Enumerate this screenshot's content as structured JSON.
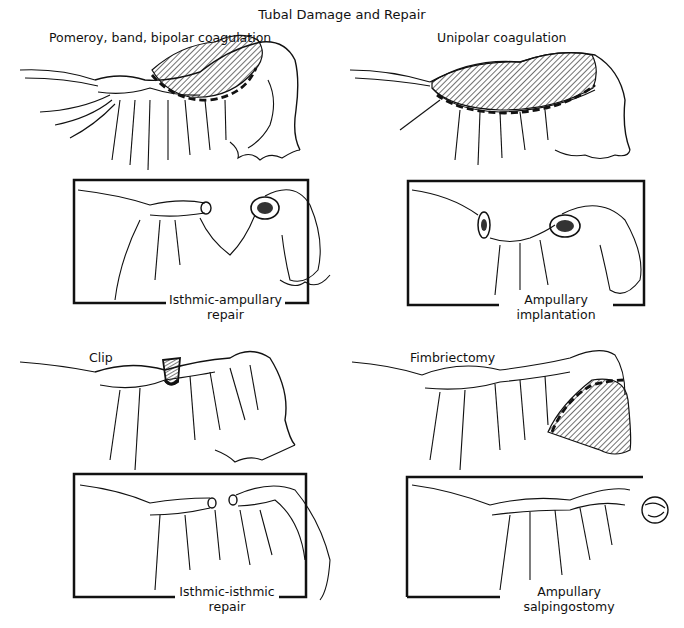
{
  "title": "Tubal Damage and Repair",
  "panels": [
    {
      "id": "top-left",
      "damage_label": "Pomeroy, band, bipolar coagulation",
      "repair_caption_line1": "Isthmic-ampullary",
      "repair_caption_line2": "repair"
    },
    {
      "id": "top-right",
      "damage_label": "Unipolar coagulation",
      "repair_caption_line1": "Ampullary",
      "repair_caption_line2": "implantation"
    },
    {
      "id": "bottom-left",
      "damage_label": "Clip",
      "repair_caption_line1": "Isthmic-isthmic",
      "repair_caption_line2": "repair"
    },
    {
      "id": "bottom-right",
      "damage_label": "Fimbriectomy",
      "repair_caption_line1": "Ampullary",
      "repair_caption_line2": "salpingostomy"
    }
  ],
  "colors": {
    "ink": "#111111",
    "background": "#ffffff"
  }
}
